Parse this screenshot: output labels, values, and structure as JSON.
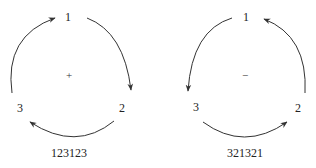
{
  "diagrams": [
    {
      "name": "even-cycle",
      "sign": "+",
      "nodes": [
        "1",
        "2",
        "3"
      ],
      "sequence": "123123",
      "direction": "clockwise"
    },
    {
      "name": "odd-cycle",
      "sign": "−",
      "nodes": [
        "1",
        "2",
        "3"
      ],
      "sequence": "321321",
      "direction": "counterclockwise"
    }
  ],
  "colors": {
    "stroke": "#333333",
    "text": "#222222",
    "background": "#ffffff"
  }
}
